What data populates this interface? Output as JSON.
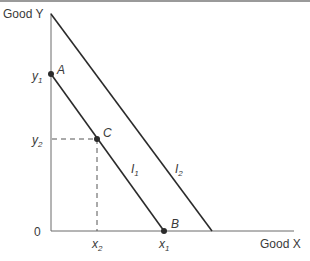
{
  "diagram": {
    "axes": {
      "y_label": "Good Y",
      "x_label": "Good X",
      "origin_label": "0"
    },
    "ticks": {
      "y1": {
        "base": "y",
        "sub": "1"
      },
      "y2": {
        "base": "y",
        "sub": "2"
      },
      "x1": {
        "base": "x",
        "sub": "1"
      },
      "x2": {
        "base": "x",
        "sub": "2"
      }
    },
    "points": {
      "A": {
        "label": "A"
      },
      "B": {
        "label": "B"
      },
      "C": {
        "label": "C"
      }
    },
    "lines": {
      "I1": {
        "base": "I",
        "sub": "1"
      },
      "I2": {
        "base": "I",
        "sub": "2"
      }
    },
    "colors": {
      "line": "#2b2b2b",
      "text": "#3a3a3a",
      "dash": "#555555",
      "border": "#9a9a9a"
    }
  }
}
